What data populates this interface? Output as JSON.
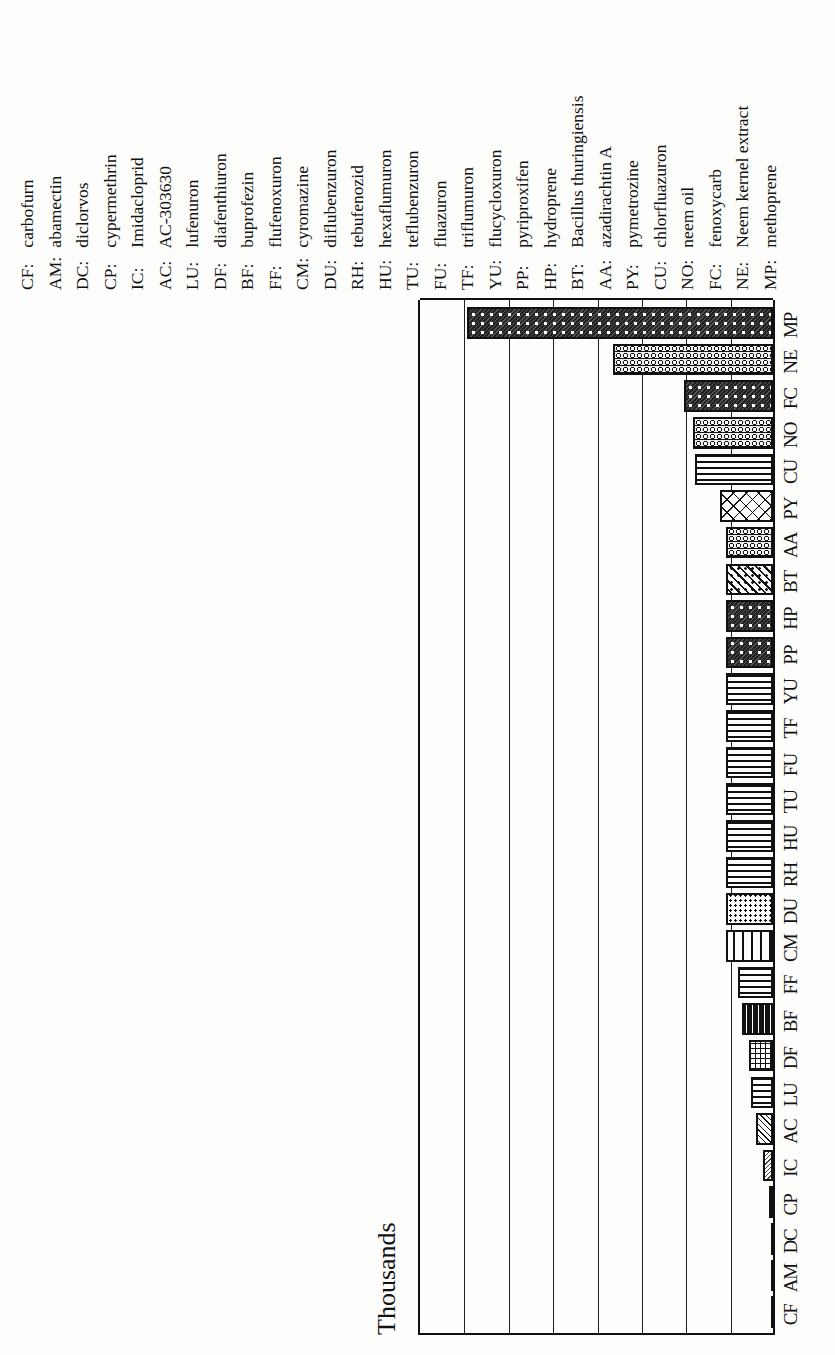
{
  "chart_data": {
    "type": "bar",
    "orientation": "vertical bars, whole figure rotated 90° counter-clockwise",
    "title": "",
    "xlabel": "",
    "ylabel": "Thousands",
    "ylim": [
      0,
      8
    ],
    "grid": true,
    "gridlines_count": 8,
    "legend_position": "right (as abbreviation key)",
    "categories": [
      "CF",
      "AM",
      "DC",
      "CP",
      "IC",
      "AC",
      "LU",
      "DF",
      "BF",
      "FF",
      "CM",
      "DU",
      "RH",
      "HU",
      "TU",
      "FU",
      "TF",
      "YU",
      "PP",
      "HP",
      "BT",
      "AA",
      "PY",
      "CU",
      "NO",
      "FC",
      "NE",
      "MP"
    ],
    "values": [
      0.02,
      0.02,
      0.03,
      0.1,
      0.22,
      0.38,
      0.5,
      0.55,
      0.7,
      0.8,
      1.05,
      1.05,
      1.05,
      1.05,
      1.05,
      1.05,
      1.05,
      1.05,
      1.05,
      1.05,
      1.05,
      1.05,
      1.2,
      1.75,
      1.8,
      2.0,
      3.6,
      6.9
    ],
    "patterns": [
      "line",
      "line",
      "line",
      "dashed",
      "striped",
      "diagonal",
      "wave",
      "grid",
      "brick-dark",
      "wave",
      "brick",
      "dots",
      "wave",
      "wave",
      "wave",
      "wave",
      "wave",
      "wave",
      "dark-dots",
      "dark-dots",
      "diagonal-dots",
      "ring",
      "crosshatch",
      "wave",
      "ring",
      "dark-dots",
      "ring",
      "dark-dots"
    ]
  },
  "axis": {
    "ylabel": "Thousands"
  },
  "legend": [
    {
      "code": "CF:",
      "name": "carbofurn"
    },
    {
      "code": "AM:",
      "name": "abamectin"
    },
    {
      "code": "DC:",
      "name": "diclorvos"
    },
    {
      "code": "CP:",
      "name": "cypermethrin"
    },
    {
      "code": "IC:",
      "name": "Imidacloprid"
    },
    {
      "code": "AC:",
      "name": "AC-303630"
    },
    {
      "code": "LU:",
      "name": "lufenuron"
    },
    {
      "code": "DF:",
      "name": "diafenthiuron"
    },
    {
      "code": "BF:",
      "name": "buprofezin"
    },
    {
      "code": "FF:",
      "name": "flufenoxuron"
    },
    {
      "code": "CM:",
      "name": "cyromazine"
    },
    {
      "code": "DU:",
      "name": "diflubenzuron"
    },
    {
      "code": "RH:",
      "name": "tebufenozid"
    },
    {
      "code": "HU:",
      "name": "hexaflumuron"
    },
    {
      "code": "TU:",
      "name": "teflubenzuron"
    },
    {
      "code": "FU:",
      "name": "fluazuron"
    },
    {
      "code": "TF:",
      "name": "triflumuron"
    },
    {
      "code": "YU:",
      "name": "flucycloxuron"
    },
    {
      "code": "PP:",
      "name": "pyriproxifen"
    },
    {
      "code": "HP:",
      "name": "hydroprene"
    },
    {
      "code": "BT:",
      "name": "Bacillus thuringiensis"
    },
    {
      "code": "AA:",
      "name": "azadirachtin A"
    },
    {
      "code": "PY:",
      "name": "pymetrozine"
    },
    {
      "code": "CU:",
      "name": "chlorfluazuron"
    },
    {
      "code": "NO:",
      "name": "neem oil"
    },
    {
      "code": "FC:",
      "name": "fenoxycarb"
    },
    {
      "code": "NE:",
      "name": "Neem kernel extract"
    },
    {
      "code": "MP:",
      "name": "methoprene"
    }
  ]
}
